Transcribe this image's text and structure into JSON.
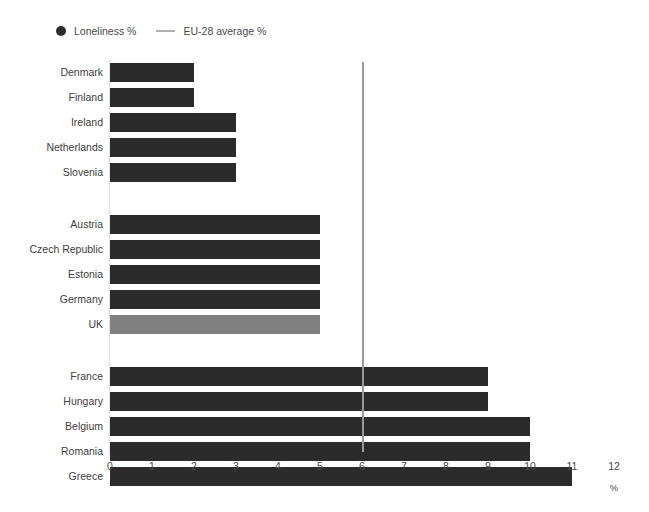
{
  "legend": {
    "items": [
      {
        "label": "Loneliness %",
        "marker": "dot",
        "color": "#2b2b2b"
      },
      {
        "label": "EU-28 average %",
        "marker": "line",
        "color": "#b0b0b0"
      }
    ]
  },
  "axis": {
    "x_title": "%",
    "x_ticks": [
      "0",
      "1",
      "2",
      "3",
      "4",
      "5",
      "6",
      "7",
      "8",
      "9",
      "10",
      "11",
      "12"
    ]
  },
  "chart_data": {
    "type": "bar",
    "orientation": "horizontal",
    "title": "",
    "xlabel": "%",
    "ylabel": "",
    "xlim": [
      0,
      12
    ],
    "xticks": [
      0,
      1,
      2,
      3,
      4,
      5,
      6,
      7,
      8,
      9,
      10,
      11,
      12
    ],
    "grid": false,
    "legend_position": "top-left",
    "bar_color": "#2b2b2b",
    "highlight_color": "#808080",
    "reference_line": {
      "label": "EU-28 average %",
      "value": 6,
      "color": "#9a9a9a"
    },
    "series": [
      {
        "name": "Loneliness %",
        "categories": [
          "Denmark",
          "Finland",
          "Ireland",
          "Netherlands",
          "Slovenia",
          "Austria",
          "Czech Republic",
          "Estonia",
          "Germany",
          "UK",
          "France",
          "Hungary",
          "Belgium",
          "Romania",
          "Greece"
        ],
        "values": [
          2,
          2,
          3,
          3,
          3,
          5,
          5,
          5,
          5,
          5,
          9,
          9,
          10,
          10,
          11
        ]
      }
    ],
    "groups": [
      {
        "bars": [
          {
            "category": "Denmark",
            "value": 2,
            "highlight": false
          },
          {
            "category": "Finland",
            "value": 2,
            "highlight": false
          },
          {
            "category": "Ireland",
            "value": 3,
            "highlight": false
          },
          {
            "category": "Netherlands",
            "value": 3,
            "highlight": false
          },
          {
            "category": "Slovenia",
            "value": 3,
            "highlight": false
          }
        ]
      },
      {
        "bars": [
          {
            "category": "Austria",
            "value": 5,
            "highlight": false
          },
          {
            "category": "Czech Republic",
            "value": 5,
            "highlight": false
          },
          {
            "category": "Estonia",
            "value": 5,
            "highlight": false
          },
          {
            "category": "Germany",
            "value": 5,
            "highlight": false
          },
          {
            "category": "UK",
            "value": 5,
            "highlight": true
          }
        ]
      },
      {
        "bars": [
          {
            "category": "France",
            "value": 9,
            "highlight": false
          },
          {
            "category": "Hungary",
            "value": 9,
            "highlight": false
          },
          {
            "category": "Belgium",
            "value": 10,
            "highlight": false
          },
          {
            "category": "Romania",
            "value": 10,
            "highlight": false
          },
          {
            "category": "Greece",
            "value": 11,
            "highlight": false
          }
        ]
      }
    ]
  }
}
